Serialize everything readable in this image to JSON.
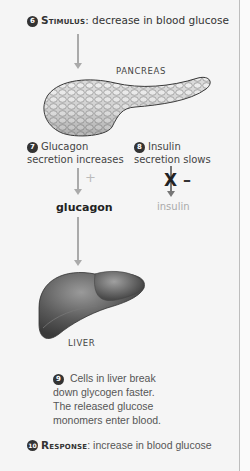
{
  "stimulus": {
    "number": "6",
    "heading": "Stimulus",
    "text": ": decrease in blood glucose"
  },
  "pancreas": {
    "label": "PANCREAS"
  },
  "step7": {
    "number": "7",
    "line1": "Glucagon",
    "line2": "secretion increases",
    "sign": "+"
  },
  "step8": {
    "number": "8",
    "line1": "Insulin",
    "line2": "secretion slows",
    "block": "X",
    "sign": "–"
  },
  "hormones": {
    "glucagon": "glucagon",
    "insulin": "insulin"
  },
  "liver": {
    "label": "LIVER"
  },
  "step9": {
    "number": "9",
    "line1": "Cells in liver break",
    "line2": "down glycogen faster.",
    "line3": "The released glucose",
    "line4": "monomers enter blood."
  },
  "response": {
    "number": "10",
    "heading": "Response",
    "text": ": increase in blood glucose"
  },
  "colors": {
    "background": "#f5f5f5",
    "arrow": "#aaaaaa",
    "text": "#333333",
    "muted": "#aaaaaa",
    "badge": "#333333"
  }
}
